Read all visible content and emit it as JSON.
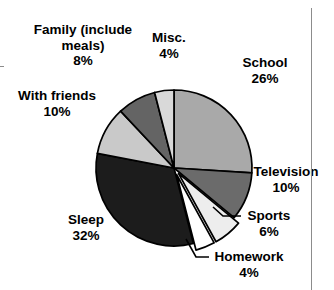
{
  "chart_data": {
    "type": "pie",
    "title": "",
    "subtitle": "",
    "xlabel": "",
    "ylabel": "",
    "legend_position": "none",
    "grid": false,
    "units": "%",
    "total": 100,
    "start_angle_deg": 0,
    "direction": "clockwise",
    "categories": [
      "School",
      "Television",
      "Sports",
      "Homework",
      "Sleep",
      "With friends",
      "Family (include meals)",
      "Misc."
    ],
    "values": [
      26,
      10,
      6,
      4,
      32,
      10,
      8,
      4
    ],
    "slices": [
      {
        "label": "School",
        "value": 26,
        "value_text": "26%",
        "color": "#a9a9a9",
        "exploded": false
      },
      {
        "label": "Television",
        "value": 10,
        "value_text": "10%",
        "color": "#6b6b6b",
        "exploded": false
      },
      {
        "label": "Sports",
        "value": 6,
        "value_text": "6%",
        "color": "#ededed",
        "exploded": true
      },
      {
        "label": "Homework",
        "value": 4,
        "value_text": "4%",
        "color": "#ffffff",
        "exploded": true
      },
      {
        "label": "Sleep",
        "value": 32,
        "value_text": "32%",
        "color": "#1c1c1c",
        "exploded": false
      },
      {
        "label": "With friends",
        "value": 10,
        "value_text": "10%",
        "color": "#c9c9c9",
        "exploded": false
      },
      {
        "label": "Family (include meals)",
        "value": 8,
        "value_text": "8%",
        "color": "#646464",
        "exploded": false
      },
      {
        "label": "Misc.",
        "value": 4,
        "value_text": "4%",
        "color": "#d9d9d9",
        "exploded": false
      }
    ],
    "outline_color": "#000000"
  },
  "labels": {
    "family": {
      "name": "Family (include meals)",
      "pct": "8%"
    },
    "misc": {
      "name": "Misc.",
      "pct": "4%"
    },
    "school": {
      "name": "School",
      "pct": "26%"
    },
    "television": {
      "name": "Television",
      "pct": "10%"
    },
    "sports": {
      "name": "Sports",
      "pct": "6%"
    },
    "homework": {
      "name": "Homework",
      "pct": "4%"
    },
    "sleep": {
      "name": "Sleep",
      "pct": "32%"
    },
    "with_friends": {
      "name": "With friends",
      "pct": "10%"
    }
  }
}
